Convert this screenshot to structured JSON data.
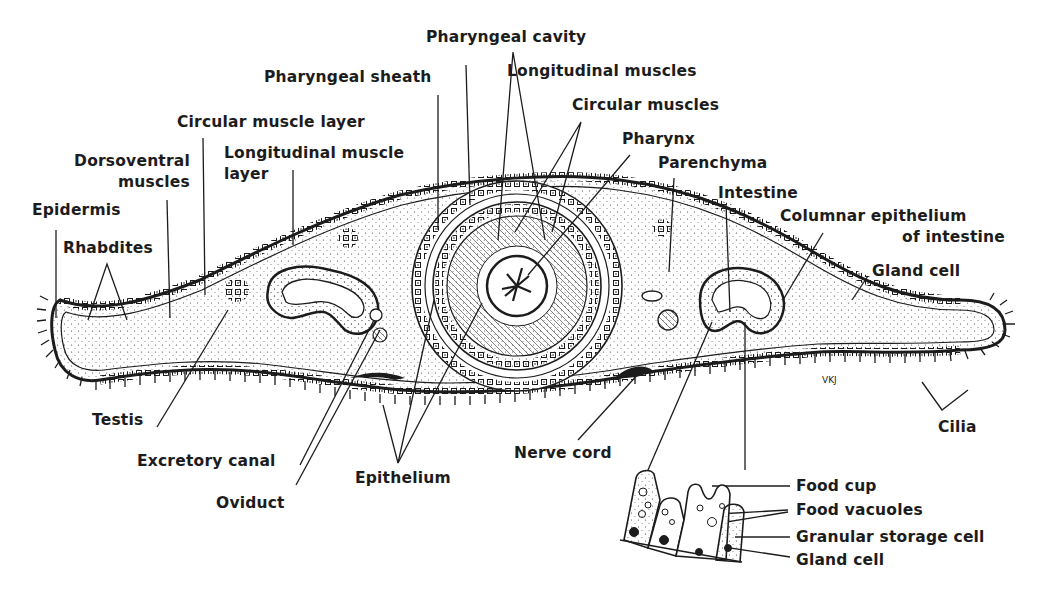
{
  "figure": {
    "type": "anatomical cross-section diagram",
    "signature": "VKJ",
    "colors": {
      "ink": "#1c1c1c",
      "background": "#ffffff"
    }
  },
  "labels": {
    "pharyngeal_cavity": "Pharyngeal cavity",
    "pharyngeal_sheath": "Pharyngeal sheath",
    "longitudinal_muscles": "Longitudinal muscles",
    "circular_muscles": "Circular muscles",
    "circular_muscle_layer": "Circular muscle layer",
    "pharynx": "Pharynx",
    "parenchyma": "Parenchyma",
    "dorsoventral_muscles_1": "Dorsoventral",
    "dorsoventral_muscles_2": "muscles",
    "longitudinal_muscle_layer_1": "Longitudinal muscle",
    "longitudinal_muscle_layer_2": "layer",
    "intestine": "Intestine",
    "columnar_epithelium_1": "Columnar epithelium",
    "columnar_epithelium_2": "of intestine",
    "epidermis": "Epidermis",
    "rhabdites": "Rhabdites",
    "gland_cell_top": "Gland cell",
    "testis": "Testis",
    "cilia": "Cilia",
    "excretory_canal": "Excretory canal",
    "nerve_cord": "Nerve cord",
    "epithelium": "Epithelium",
    "oviduct": "Oviduct",
    "food_cup": "Food cup",
    "food_vacuoles": "Food vacuoles",
    "granular_storage_cell": "Granular storage cell",
    "gland_cell_inset": "Gland cell"
  },
  "inset": {
    "title": "Intestinal epithelium detail",
    "parts": [
      "Food cup",
      "Food vacuoles",
      "Granular storage cell",
      "Gland cell"
    ]
  }
}
